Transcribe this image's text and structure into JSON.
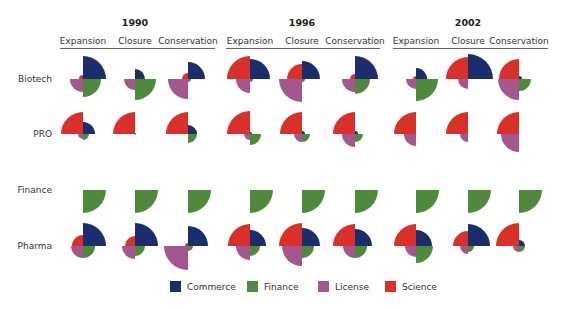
{
  "chart_data": {
    "type": "polar-area-quadrant-grid",
    "title": "",
    "years": [
      "1990",
      "1996",
      "2002"
    ],
    "columns": [
      "Expansion",
      "Closure",
      "Conservation"
    ],
    "rows": [
      "Biotech",
      "PRO",
      "Finance",
      "Pharma"
    ],
    "quadrant_order": [
      "Commerce (top-right)",
      "Finance (bottom-right)",
      "License (bottom-left)",
      "Science (top-left)"
    ],
    "legend": [
      {
        "name": "Commerce",
        "color": "#1c2d6b"
      },
      {
        "name": "Finance",
        "color": "#4f8a3c"
      },
      {
        "name": "License",
        "color": "#a4578f"
      },
      {
        "name": "Science",
        "color": "#d9302a"
      }
    ],
    "units": "wedge radius in px (approx.)",
    "cells": {
      "Biotech": {
        "1990": {
          "Expansion": [
            23,
            18,
            13,
            4
          ],
          "Closure": [
            10,
            21,
            11,
            0
          ],
          "Conservation": [
            17,
            3,
            20,
            6
          ]
        },
        "1996": {
          "Expansion": [
            20,
            3,
            14,
            23
          ],
          "Closure": [
            18,
            3,
            23,
            15
          ],
          "Conservation": [
            23,
            15,
            13,
            5
          ]
        },
        "2002": {
          "Expansion": [
            11,
            22,
            10,
            3
          ],
          "Closure": [
            25,
            0,
            10,
            22
          ],
          "Conservation": [
            3,
            12,
            21,
            20
          ]
        }
      },
      "PRO": {
        "1990": {
          "Expansion": [
            12,
            6,
            5,
            22
          ],
          "Closure": [
            1,
            1,
            0,
            22
          ],
          "Conservation": [
            9,
            9,
            0,
            22
          ]
        },
        "1996": {
          "Expansion": [
            2,
            11,
            6,
            23
          ],
          "Closure": [
            3,
            8,
            8,
            22
          ],
          "Conservation": [
            3,
            8,
            13,
            22
          ]
        },
        "2002": {
          "Expansion": [
            0,
            0,
            12,
            22
          ],
          "Closure": [
            0,
            0,
            8,
            22
          ],
          "Conservation": [
            0,
            0,
            18,
            22
          ]
        }
      },
      "Finance": {
        "1990": {
          "Expansion": [
            0,
            23,
            0,
            0
          ],
          "Closure": [
            0,
            23,
            0,
            0
          ],
          "Conservation": [
            0,
            23,
            0,
            0
          ]
        },
        "1996": {
          "Expansion": [
            0,
            23,
            0,
            0
          ],
          "Closure": [
            0,
            23,
            0,
            0
          ],
          "Conservation": [
            0,
            23,
            0,
            0
          ]
        },
        "2002": {
          "Expansion": [
            0,
            23,
            0,
            0
          ],
          "Closure": [
            0,
            23,
            0,
            0
          ],
          "Conservation": [
            0,
            23,
            0,
            0
          ]
        }
      },
      "Pharma": {
        "1990": {
          "Expansion": [
            23,
            12,
            12,
            11
          ],
          "Closure": [
            23,
            10,
            13,
            10
          ],
          "Conservation": [
            20,
            5,
            24,
            3
          ]
        },
        "1996": {
          "Expansion": [
            16,
            10,
            14,
            22
          ],
          "Closure": [
            18,
            12,
            20,
            23
          ],
          "Conservation": [
            17,
            12,
            12,
            22
          ]
        },
        "2002": {
          "Expansion": [
            16,
            17,
            11,
            22
          ],
          "Closure": [
            22,
            6,
            8,
            15
          ],
          "Conservation": [
            6,
            6,
            6,
            23
          ]
        }
      }
    }
  },
  "layout": {
    "col_x": [
      83,
      135,
      188,
      250,
      302,
      355,
      416,
      468,
      519
    ],
    "row_y": [
      79,
      134,
      190,
      246
    ],
    "year_x": [
      135,
      302,
      468
    ],
    "rule_spans": [
      [
        60,
        215
      ],
      [
        226,
        380
      ],
      [
        393,
        548
      ]
    ],
    "row_label_x": 52,
    "legend_x": [
      170,
      247,
      318,
      385
    ]
  }
}
